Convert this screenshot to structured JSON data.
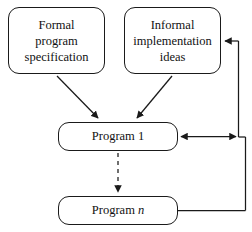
{
  "diagram": {
    "stroke_color": "#1a1a1a",
    "background_color": "#ffffff",
    "nodes": [
      {
        "id": "formal-specification",
        "lines": [
          "Formal",
          "program",
          "specification"
        ],
        "shape": "rounded-rectangle"
      },
      {
        "id": "informal-ideas",
        "lines": [
          "Informal",
          "implementation",
          "ideas"
        ],
        "shape": "rounded-rectangle"
      },
      {
        "id": "program-1",
        "label": "Program 1",
        "label_text": "Program",
        "label_index": "1",
        "shape": "rounded-rectangle"
      },
      {
        "id": "program-n",
        "label": "Program n",
        "label_text": "Program",
        "label_index": "n",
        "shape": "rounded-rectangle"
      }
    ],
    "edges": [
      {
        "id": "formal-to-program-1",
        "from": "formal-specification",
        "to": "program-1",
        "style": "solid",
        "arrowheads": "end"
      },
      {
        "id": "informal-to-program-1",
        "from": "informal-ideas",
        "to": "program-1",
        "style": "solid",
        "arrowheads": "end"
      },
      {
        "id": "program-1-to-program-n",
        "from": "program-1",
        "to": "program-n",
        "style": "dashed",
        "arrowheads": "end"
      },
      {
        "id": "program-1-feedback-bus",
        "from": "program-1",
        "to": "feedback-bus",
        "style": "solid",
        "arrowheads": "both"
      },
      {
        "id": "feedback-to-informal",
        "from": "feedback-bus",
        "to": "informal-ideas",
        "style": "solid",
        "arrowheads": "end"
      },
      {
        "id": "program-n-to-feedback-bus",
        "from": "program-n",
        "to": "feedback-bus",
        "style": "solid",
        "arrowheads": "none"
      }
    ]
  }
}
